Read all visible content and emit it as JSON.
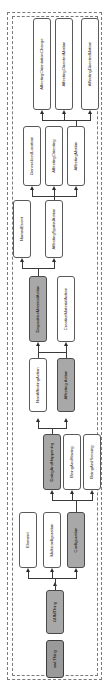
{
  "diagram": {
    "orientation": "rotated-90",
    "root_label": "owl:Thing",
    "colors": {
      "node_fill": "#ffffff",
      "node_highlight_fill": "#a8a8a8",
      "node_border": "#5a5a5a",
      "edge": "#3a3a3a",
      "frame_border": "#7a7a7a",
      "background": "#ffffff"
    },
    "nodes": [
      {
        "id": "n1",
        "label": "AffectingOrientationChange",
        "highlight": false
      },
      {
        "id": "n2",
        "label": "AffectingOrientedMotion",
        "highlight": false
      },
      {
        "id": "n3",
        "label": "AffectingDirectedMotion",
        "highlight": false
      },
      {
        "id": "n4",
        "label": "GeneralizedLocation",
        "highlight": false
      },
      {
        "id": "n5",
        "label": "AffectingOrienting",
        "highlight": false
      },
      {
        "id": "n6",
        "label": "AffectingMotion",
        "highlight": false
      },
      {
        "id": "n7",
        "label": "NamedEvent",
        "highlight": false
      },
      {
        "id": "n8",
        "label": "AffectingSpatialAction",
        "highlight": false
      },
      {
        "id": "n9",
        "label": "DispositiveMaterialAction",
        "highlight": true
      },
      {
        "id": "n10",
        "label": "CreativeMaterialAction",
        "highlight": false
      },
      {
        "id": "n11",
        "label": "NonAffectingAction",
        "highlight": false
      },
      {
        "id": "n12",
        "label": "Affecting Action",
        "highlight": true
      },
      {
        "id": "n13",
        "label": "DoingAndHappening",
        "highlight": true
      },
      {
        "id": "n14",
        "label": "BeingAndHaving",
        "highlight": false
      },
      {
        "id": "n15",
        "label": "BeingAndSensing",
        "highlight": false
      },
      {
        "id": "n16",
        "label": "Element",
        "highlight": false
      },
      {
        "id": "n17",
        "label": "Multiconfiguration",
        "highlight": false
      },
      {
        "id": "n18",
        "label": "Configuration",
        "highlight": true
      },
      {
        "id": "n19",
        "label": "GUMThing",
        "highlight": true
      },
      {
        "id": "n20",
        "label": "owl:Thing",
        "highlight": true
      }
    ],
    "edges": [
      {
        "from": "n8",
        "to": "n4"
      },
      {
        "from": "n8",
        "to": "n5"
      },
      {
        "from": "n8",
        "to": "n6"
      },
      {
        "from": "n6",
        "to": "n1"
      },
      {
        "from": "n6",
        "to": "n2"
      },
      {
        "from": "n6",
        "to": "n3"
      },
      {
        "from": "n9",
        "to": "n7"
      },
      {
        "from": "n9",
        "to": "n8"
      },
      {
        "from": "n11",
        "to": "n9"
      },
      {
        "from": "n12",
        "to": "n9"
      },
      {
        "from": "n12",
        "to": "n10"
      },
      {
        "from": "n13",
        "to": "n11"
      },
      {
        "from": "n13",
        "to": "n12"
      },
      {
        "from": "n18",
        "to": "n13"
      },
      {
        "from": "n18",
        "to": "n14"
      },
      {
        "from": "n18",
        "to": "n15"
      },
      {
        "from": "n19",
        "to": "n16"
      },
      {
        "from": "n19",
        "to": "n17"
      },
      {
        "from": "n19",
        "to": "n18"
      },
      {
        "from": "n20",
        "to": "n19"
      }
    ]
  }
}
